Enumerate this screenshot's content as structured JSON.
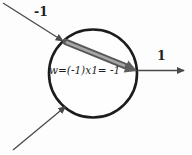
{
  "diagram": {
    "type": "neuron-weight-diagram",
    "node_equation": "w=(-1)x1= -1",
    "input_top_label": "-1",
    "output_label": "1",
    "colors": {
      "background": "#fdfdfd",
      "thin_line": "#4a4a4a",
      "circle_stroke": "#1c1c1c",
      "circle_fill": "#fefefe",
      "weight_arrow_dark": "#575757",
      "weight_arrow_highlight": "#a6a6a6",
      "weight_arrowhead": "#5e5e5e",
      "text": "#1f1f1f"
    }
  }
}
